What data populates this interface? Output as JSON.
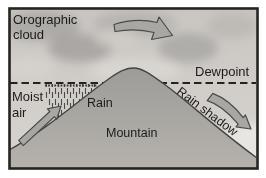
{
  "figure": {
    "labels": {
      "cloud_line1": "Orographic",
      "cloud_line2": "cloud",
      "dewpoint": "Dewpoint",
      "moist_line1": "Moist",
      "moist_line2": "air",
      "rain": "Rain",
      "mountain": "Mountain",
      "rain_shadow": "Rain shadow"
    },
    "colors": {
      "frame": "#26241f",
      "sky_top": "#c9c6c2",
      "sky_bottom": "#d8d5d0",
      "cloud_gray": "#a5a3a0",
      "mountain_top": "#9e9c98",
      "mountain_base": "#b5b2ad",
      "ridge_outline": "#45443f",
      "arrow_fill": "#a9a7a3",
      "arrow_outline": "#4c4b49",
      "dewpoint_line": "#23221e",
      "text": "#1c1b19"
    }
  }
}
